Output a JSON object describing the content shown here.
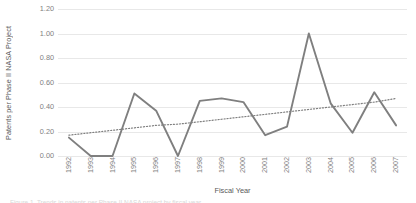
{
  "chart_data": {
    "type": "line",
    "title": "",
    "xlabel": "Fiscal Year",
    "ylabel": "Patents per Phase II NASA Project",
    "categories": [
      "1992",
      "1993",
      "1994",
      "1995",
      "1996",
      "1997",
      "1998",
      "1999",
      "2000",
      "2001",
      "2002",
      "2003",
      "2004",
      "2005",
      "2006",
      "2007"
    ],
    "ylim": [
      0.0,
      1.2
    ],
    "yticks": [
      "0.00",
      "0.20",
      "0.40",
      "0.60",
      "0.80",
      "1.00",
      "1.20"
    ],
    "ytick_values": [
      0.0,
      0.2,
      0.4,
      0.6,
      0.8,
      1.0,
      1.2
    ],
    "grid": true,
    "legend": "none",
    "series": [
      {
        "name": "Patents per Phase II NASA Project",
        "style": "solid",
        "color": "#7f7f7f",
        "values": [
          0.15,
          0.0,
          0.0,
          0.51,
          0.37,
          0.0,
          0.45,
          0.47,
          0.44,
          0.17,
          0.24,
          1.0,
          0.43,
          0.19,
          0.52,
          0.25
        ]
      },
      {
        "name": "Linear trend",
        "style": "dotted",
        "color": "#808080",
        "values": [
          0.17,
          0.19,
          0.21,
          0.23,
          0.25,
          0.26,
          0.28,
          0.3,
          0.32,
          0.34,
          0.36,
          0.38,
          0.4,
          0.42,
          0.44,
          0.47
        ]
      }
    ]
  },
  "axis": {
    "x_title": "Fiscal Year",
    "y_title": "Patents per Phase II NASA Project"
  },
  "footer": {
    "caption": "Figure 1. Trends in patents per Phase II NASA project by fiscal year"
  }
}
